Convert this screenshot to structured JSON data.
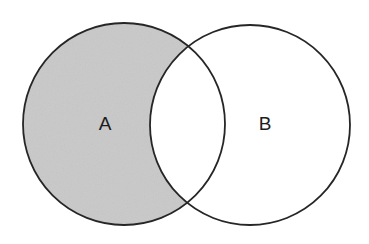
{
  "diagram": {
    "kind": "venn-diagram",
    "title": "",
    "background_color": "#ffffff",
    "stroke_color": "#262626",
    "stroke_width": 1.8,
    "shade_color": "#c9c9c9",
    "unshaded_color": "#ffffff",
    "shaded_region_description": "A minus B (A difference B)",
    "sets": [
      {
        "id": "A",
        "label": "A",
        "label_x": 105,
        "label_y": 125,
        "center_x": 124,
        "center_y": 124,
        "radius": 101,
        "fill": "#c9c9c9",
        "filled": true
      },
      {
        "id": "B",
        "label": "B",
        "label_x": 265,
        "label_y": 125,
        "center_x": 250,
        "center_y": 125,
        "radius": 100,
        "fill": "#ffffff",
        "filled": false
      }
    ],
    "intersection": {
      "label": "",
      "fill": "#ffffff",
      "shaded": false,
      "upper_point_x": 188,
      "upper_point_y": 48,
      "lower_point_x": 188,
      "lower_point_y": 200
    }
  }
}
